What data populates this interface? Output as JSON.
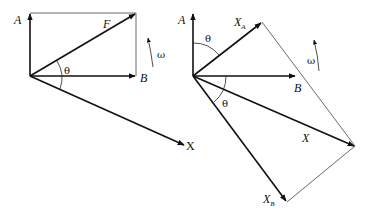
{
  "figure": {
    "background": "#ffffff",
    "stroke_color": "#111111"
  },
  "left_diagram": {
    "labels": {
      "A": "A",
      "F": "F",
      "B": "B",
      "theta": "θ",
      "omega": "ω",
      "X": "X"
    },
    "vectors": [
      {
        "name": "A",
        "from": [
          30,
          76
        ],
        "to": [
          30,
          13
        ]
      },
      {
        "name": "B",
        "from": [
          30,
          76
        ],
        "to": [
          136,
          76
        ]
      },
      {
        "name": "F",
        "from": [
          30,
          76
        ],
        "to": [
          136,
          13
        ]
      },
      {
        "name": "X",
        "from": [
          30,
          76
        ],
        "to": [
          185,
          145
        ]
      }
    ],
    "construction_lines": [
      {
        "from": [
          30,
          13
        ],
        "to": [
          136,
          13
        ]
      },
      {
        "from": [
          136,
          13
        ],
        "to": [
          136,
          76
        ]
      }
    ]
  },
  "right_diagram": {
    "labels": {
      "A": "A",
      "X_A_main": "X",
      "X_A_sub": "A",
      "B": "B",
      "theta_top": "θ",
      "theta_bottom": "θ",
      "omega": "ω",
      "X": "X",
      "X_B_main": "X",
      "X_B_sub": "B"
    },
    "vectors": [
      {
        "name": "A",
        "from": [
          193,
          76
        ],
        "to": [
          193,
          13
        ]
      },
      {
        "name": "X_A",
        "from": [
          193,
          76
        ],
        "to": [
          262,
          22
        ]
      },
      {
        "name": "B",
        "from": [
          193,
          76
        ],
        "to": [
          296,
          76
        ]
      },
      {
        "name": "X",
        "from": [
          193,
          76
        ],
        "to": [
          355,
          146
        ]
      },
      {
        "name": "X_B",
        "from": [
          193,
          76
        ],
        "to": [
          287,
          202
        ]
      }
    ],
    "construction_lines": [
      {
        "from": [
          262,
          22
        ],
        "to": [
          355,
          146
        ]
      },
      {
        "from": [
          355,
          146
        ],
        "to": [
          287,
          202
        ]
      }
    ]
  }
}
